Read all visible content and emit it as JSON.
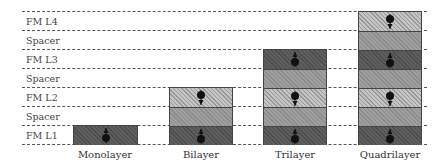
{
  "diagram": {
    "rows": [
      {
        "label": "FM L4"
      },
      {
        "label": "Spacer"
      },
      {
        "label": "FM L3"
      },
      {
        "label": "Spacer"
      },
      {
        "label": "FM L2"
      },
      {
        "label": "Spacer"
      },
      {
        "label": "FM L1"
      }
    ],
    "columns": [
      {
        "label": "Monolayer",
        "layers": [
          "fm-up"
        ]
      },
      {
        "label": "Bilayer",
        "layers": [
          "fm-up",
          "spacer",
          "fm-down"
        ]
      },
      {
        "label": "Trilayer",
        "layers": [
          "fm-up",
          "spacer",
          "fm-down",
          "spacer",
          "fm-up"
        ]
      },
      {
        "label": "Quadrilayer",
        "layers": [
          "fm-up",
          "spacer",
          "fm-down",
          "spacer",
          "fm-up",
          "spacer",
          "fm-down"
        ]
      }
    ],
    "icons": {
      "fm-up": "spin-up-icon",
      "fm-down": "spin-down-icon"
    },
    "colors": {
      "fm_dark": "#5e5e5e",
      "fm_light": "#c4c4c4",
      "spacer": "#9e9e9e",
      "border": "#444444"
    }
  }
}
